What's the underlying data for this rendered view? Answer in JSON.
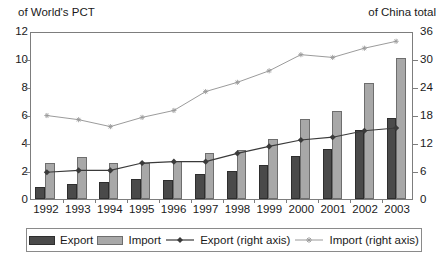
{
  "header": {
    "left_caption": "of World's PCT",
    "right_caption": "of China total"
  },
  "chart_data": {
    "type": "bar",
    "title": "",
    "subtitle": "",
    "xlabel": "",
    "ylabel": "of World's PCT",
    "y2label": "of China total",
    "ylim": [
      0,
      12
    ],
    "y2lim": [
      0,
      36
    ],
    "grid": false,
    "legend_position": "bottom",
    "categories": [
      "1992",
      "1993",
      "1994",
      "1995",
      "1996",
      "1997",
      "1998",
      "1999",
      "2000",
      "2001",
      "2002",
      "2003"
    ],
    "left_ticks": [
      "0",
      "2",
      "4",
      "6",
      "8",
      "10",
      "12"
    ],
    "left_tick_values": [
      0,
      2,
      4,
      6,
      8,
      10,
      12
    ],
    "right_ticks": [
      "0",
      "6",
      "12",
      "18",
      "24",
      "30",
      "36"
    ],
    "right_tick_values": [
      0,
      6,
      12,
      18,
      24,
      30,
      36
    ],
    "series": [
      {
        "name": "Export",
        "kind": "bar",
        "axis": "left",
        "color": "#4a4a4a",
        "values": [
          0.85,
          1.05,
          1.2,
          1.4,
          1.35,
          1.8,
          2.0,
          2.4,
          3.1,
          3.55,
          4.9,
          5.8
        ]
      },
      {
        "name": "Import",
        "kind": "bar",
        "axis": "left",
        "color": "#a8a8a8",
        "values": [
          2.55,
          3.0,
          2.6,
          2.6,
          2.75,
          3.3,
          3.5,
          4.3,
          5.75,
          6.3,
          8.3,
          10.1
        ]
      },
      {
        "name": "Export (right axis)",
        "kind": "line",
        "axis": "right",
        "color": "#3a3a3a",
        "marker": "diamond",
        "values": [
          5.8,
          6.2,
          6.2,
          7.8,
          8.1,
          8.1,
          9.9,
          11.4,
          12.8,
          13.4,
          14.8,
          15.4
        ]
      },
      {
        "name": "Import (right axis)",
        "kind": "line",
        "axis": "right",
        "color": "#9a9a9a",
        "marker": "star",
        "values": [
          18.1,
          17.2,
          15.7,
          17.7,
          19.2,
          23.3,
          25.3,
          27.8,
          31.3,
          30.7,
          32.7,
          34.2
        ]
      }
    ]
  },
  "legend": {
    "items": [
      {
        "label": "Export",
        "type": "swatch-export"
      },
      {
        "label": "Import",
        "type": "swatch-import"
      },
      {
        "label": "Export (right axis)",
        "type": "line-dark"
      },
      {
        "label": "Import (right axis)",
        "type": "line-light"
      }
    ]
  }
}
